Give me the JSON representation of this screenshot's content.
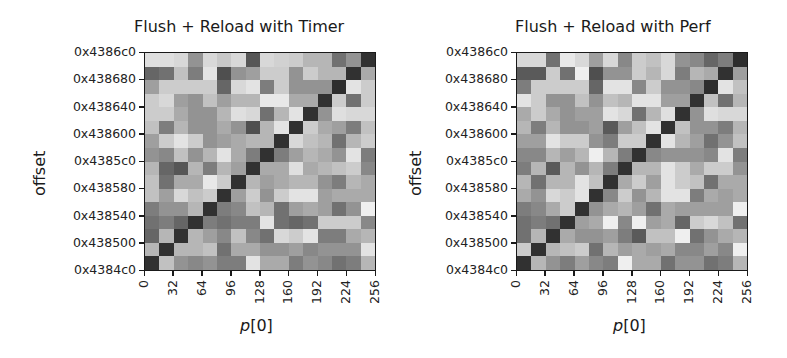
{
  "chart_data": [
    {
      "type": "heatmap",
      "title": "Flush + Reload with Timer",
      "xlabel": "p[0]",
      "ylabel": "offset",
      "xticks": [
        "0",
        "32",
        "64",
        "96",
        "128",
        "160",
        "192",
        "224",
        "256"
      ],
      "yticks": [
        "0x4386c0",
        "0x438680",
        "0x438640",
        "0x438600",
        "0x4385c0",
        "0x438580",
        "0x438540",
        "0x438500",
        "0x4384c0"
      ],
      "xlim": [
        0,
        256
      ],
      "ylim": [
        "0x4384c0",
        "0x4386c0"
      ],
      "grid_size": [
        16,
        16
      ],
      "colormap": "gray_r",
      "rows_top_to_bottom": [
        [
          0.12,
          0.12,
          0.15,
          0.45,
          0.15,
          0.22,
          0.15,
          0.72,
          0.15,
          0.18,
          0.2,
          0.3,
          0.3,
          0.6,
          0.45,
          0.88
        ],
        [
          0.65,
          0.6,
          0.25,
          0.55,
          0.1,
          0.75,
          0.45,
          0.4,
          0.2,
          0.2,
          0.45,
          0.2,
          0.3,
          0.3,
          0.88,
          0.35
        ],
        [
          0.4,
          0.2,
          0.2,
          0.2,
          0.2,
          0.65,
          0.15,
          0.1,
          0.55,
          0.2,
          0.45,
          0.45,
          0.45,
          0.9,
          0.1,
          0.2
        ],
        [
          0.2,
          0.15,
          0.4,
          0.45,
          0.25,
          0.4,
          0.3,
          0.3,
          0.08,
          0.08,
          0.35,
          0.35,
          0.88,
          0.2,
          0.6,
          0.2
        ],
        [
          0.2,
          0.2,
          0.35,
          0.45,
          0.45,
          0.3,
          0.12,
          0.15,
          0.6,
          0.3,
          0.1,
          0.88,
          0.45,
          0.12,
          0.15,
          0.15
        ],
        [
          0.25,
          0.55,
          0.3,
          0.45,
          0.45,
          0.35,
          0.45,
          0.75,
          0.3,
          0.1,
          0.88,
          0.2,
          0.35,
          0.4,
          0.55,
          0.25
        ],
        [
          0.4,
          0.2,
          0.1,
          0.2,
          0.45,
          0.4,
          0.35,
          0.3,
          0.3,
          0.88,
          0.15,
          0.25,
          0.3,
          0.6,
          0.3,
          0.2
        ],
        [
          0.45,
          0.5,
          0.25,
          0.45,
          0.3,
          0.1,
          0.35,
          0.55,
          0.88,
          0.55,
          0.4,
          0.3,
          0.35,
          0.45,
          0.1,
          0.55
        ],
        [
          0.3,
          0.65,
          0.72,
          0.3,
          0.55,
          0.3,
          0.4,
          0.88,
          0.35,
          0.35,
          0.12,
          0.35,
          0.3,
          0.25,
          0.2,
          0.5
        ],
        [
          0.25,
          0.6,
          0.35,
          0.35,
          0.08,
          0.2,
          0.88,
          0.3,
          0.4,
          0.35,
          0.3,
          0.3,
          0.45,
          0.55,
          0.3,
          0.35
        ],
        [
          0.25,
          0.4,
          0.15,
          0.25,
          0.2,
          0.88,
          0.4,
          0.2,
          0.45,
          0.2,
          0.1,
          0.1,
          0.4,
          0.35,
          0.35,
          0.35
        ],
        [
          0.55,
          0.45,
          0.45,
          0.3,
          0.88,
          0.55,
          0.5,
          0.25,
          0.3,
          0.6,
          0.4,
          0.35,
          0.4,
          0.6,
          0.45,
          0.05
        ],
        [
          0.6,
          0.55,
          0.65,
          0.88,
          0.55,
          0.6,
          0.55,
          0.55,
          0.1,
          0.6,
          0.65,
          0.6,
          0.2,
          0.2,
          0.2,
          0.5
        ],
        [
          0.65,
          0.3,
          0.88,
          0.3,
          0.4,
          0.5,
          0.25,
          0.5,
          0.6,
          0.15,
          0.2,
          0.1,
          0.55,
          0.55,
          0.35,
          0.3
        ],
        [
          0.3,
          0.88,
          0.3,
          0.3,
          0.25,
          0.6,
          0.35,
          0.35,
          0.45,
          0.45,
          0.4,
          0.5,
          0.45,
          0.45,
          0.45,
          0.1
        ],
        [
          0.88,
          0.25,
          0.45,
          0.5,
          0.45,
          0.55,
          0.55,
          0.1,
          0.35,
          0.35,
          0.55,
          0.45,
          0.5,
          0.6,
          0.55,
          0.3
        ]
      ]
    },
    {
      "type": "heatmap",
      "title": "Flush + Reload with Perf",
      "xlabel": "p[0]",
      "ylabel": "offset",
      "xticks": [
        "0",
        "32",
        "64",
        "96",
        "128",
        "160",
        "192",
        "224",
        "256"
      ],
      "yticks": [
        "0x4386c0",
        "0x438680",
        "0x438640",
        "0x438600",
        "0x4385c0",
        "0x438580",
        "0x438540",
        "0x438500",
        "0x4384c0"
      ],
      "xlim": [
        0,
        256
      ],
      "ylim": [
        "0x4384c0",
        "0x4386c0"
      ],
      "grid_size": [
        16,
        16
      ],
      "colormap": "gray_r",
      "rows_top_to_bottom": [
        [
          0.15,
          0.15,
          0.6,
          0.08,
          0.15,
          0.4,
          0.15,
          0.5,
          0.2,
          0.25,
          0.15,
          0.45,
          0.5,
          0.65,
          0.55,
          0.9
        ],
        [
          0.7,
          0.7,
          0.2,
          0.6,
          0.05,
          0.75,
          0.45,
          0.45,
          0.2,
          0.3,
          0.15,
          0.55,
          0.3,
          0.35,
          0.88,
          0.4
        ],
        [
          0.55,
          0.2,
          0.2,
          0.2,
          0.2,
          0.65,
          0.1,
          0.1,
          0.5,
          0.2,
          0.45,
          0.45,
          0.5,
          0.9,
          0.1,
          0.25
        ],
        [
          0.1,
          0.2,
          0.45,
          0.45,
          0.25,
          0.45,
          0.25,
          0.3,
          0.1,
          0.1,
          0.4,
          0.4,
          0.88,
          0.25,
          0.6,
          0.3
        ],
        [
          0.35,
          0.2,
          0.35,
          0.45,
          0.4,
          0.4,
          0.1,
          0.15,
          0.6,
          0.3,
          0.12,
          0.88,
          0.45,
          0.12,
          0.15,
          0.15
        ],
        [
          0.3,
          0.55,
          0.3,
          0.45,
          0.45,
          0.4,
          0.7,
          0.4,
          0.25,
          0.1,
          0.88,
          0.25,
          0.45,
          0.45,
          0.55,
          0.3
        ],
        [
          0.4,
          0.4,
          0.1,
          0.2,
          0.2,
          0.45,
          0.55,
          0.2,
          0.2,
          0.88,
          0.1,
          0.3,
          0.4,
          0.6,
          0.45,
          0.25
        ],
        [
          0.5,
          0.5,
          0.3,
          0.4,
          0.3,
          0.05,
          0.3,
          0.55,
          0.88,
          0.5,
          0.45,
          0.45,
          0.45,
          0.5,
          0.1,
          0.55
        ],
        [
          0.55,
          0.3,
          0.7,
          0.3,
          0.45,
          0.3,
          0.55,
          0.88,
          0.3,
          0.3,
          0.1,
          0.2,
          0.35,
          0.2,
          0.2,
          0.45
        ],
        [
          0.3,
          0.6,
          0.3,
          0.3,
          0.1,
          0.25,
          0.88,
          0.35,
          0.2,
          0.4,
          0.1,
          0.2,
          0.25,
          0.6,
          0.35,
          0.35
        ],
        [
          0.35,
          0.45,
          0.15,
          0.2,
          0.1,
          0.88,
          0.5,
          0.2,
          0.45,
          0.3,
          0.1,
          0.1,
          0.55,
          0.35,
          0.4,
          0.35
        ],
        [
          0.55,
          0.5,
          0.35,
          0.2,
          0.88,
          0.45,
          0.35,
          0.3,
          0.4,
          0.6,
          0.35,
          0.4,
          0.4,
          0.4,
          0.4,
          0.05
        ],
        [
          0.6,
          0.55,
          0.6,
          0.88,
          0.4,
          0.35,
          0.05,
          0.5,
          0.05,
          0.4,
          0.35,
          0.65,
          0.2,
          0.15,
          0.25,
          0.6
        ],
        [
          0.6,
          0.3,
          0.88,
          0.35,
          0.45,
          0.45,
          0.4,
          0.55,
          0.7,
          0.25,
          0.25,
          0.05,
          0.6,
          0.45,
          0.35,
          0.3
        ],
        [
          0.2,
          0.88,
          0.3,
          0.25,
          0.2,
          0.6,
          0.3,
          0.4,
          0.35,
          0.4,
          0.35,
          0.5,
          0.5,
          0.4,
          0.5,
          0.05
        ],
        [
          0.88,
          0.3,
          0.45,
          0.55,
          0.4,
          0.5,
          0.55,
          0.05,
          0.35,
          0.35,
          0.6,
          0.45,
          0.45,
          0.6,
          0.55,
          0.3
        ]
      ]
    }
  ],
  "panels": [
    {
      "title": "Flush + Reload with Timer",
      "ylabel": "offset",
      "xlabel_var": "p",
      "xlabel_idx": "[0]"
    },
    {
      "title": "Flush + Reload with Perf",
      "ylabel": "offset",
      "xlabel_var": "p",
      "xlabel_idx": "[0]"
    }
  ]
}
